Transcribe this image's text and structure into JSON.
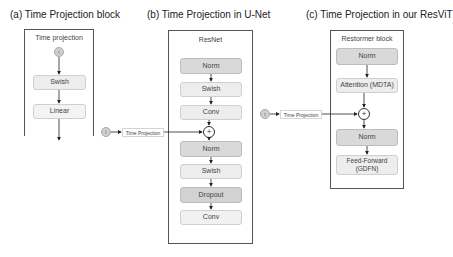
{
  "panels": {
    "a": {
      "title": "(a) Time Projection block",
      "box_label": "Time projection",
      "input_symbol": "t",
      "blocks": [
        "Swish",
        "Linear"
      ]
    },
    "b": {
      "title": "(b) Time Projection in U-Net",
      "box_label": "ResNet",
      "blocks_top": [
        "Norm",
        "Swish",
        "Conv"
      ],
      "add_symbol": "+",
      "blocks_bottom": [
        "Norm",
        "Swish",
        "Dropout",
        "Conv"
      ],
      "input_symbol": "t",
      "input_label": "Time Projection"
    },
    "c": {
      "title": "(c) Time Projection in our ResViT",
      "box_label": "Restormer block",
      "blocks_top": [
        "Norm",
        "Attention (MDTA)"
      ],
      "add_symbol": "+",
      "blocks_bottom": [
        "Norm",
        "Feed-Forward (GDFN)"
      ],
      "input_symbol": "t",
      "input_label": "Time Projection"
    }
  },
  "colors": {
    "block_dark": "#d9d9d9",
    "block_light": "#ededed",
    "outline": "#555555",
    "arrow": "#222222"
  }
}
